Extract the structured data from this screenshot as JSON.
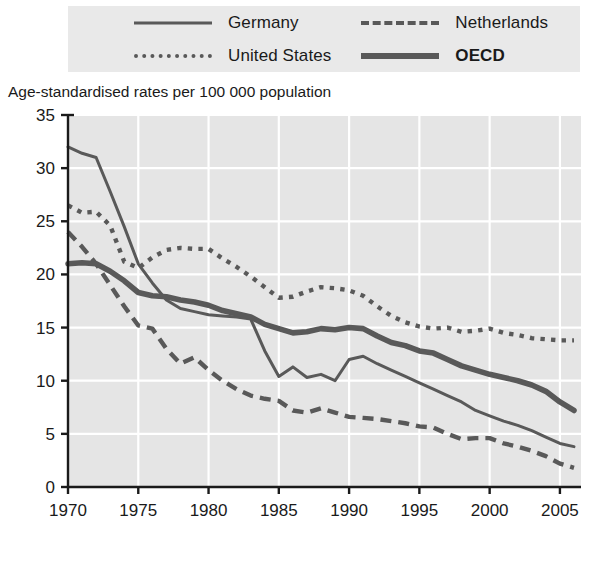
{
  "legend": {
    "items": [
      {
        "label": "Germany",
        "style": "solid-thin",
        "name": "legend-item-germany"
      },
      {
        "label": "Netherlands",
        "style": "dashed",
        "name": "legend-item-netherlands"
      },
      {
        "label": "United States",
        "style": "dotted",
        "name": "legend-item-united-states"
      },
      {
        "label": "OECD",
        "style": "solid-thick",
        "name": "legend-item-oecd",
        "bold": true
      }
    ]
  },
  "subtitle": "Age-standardised rates per 100 000 population",
  "colors": {
    "line": "#595959",
    "plot_background": "#e5e5e5",
    "gridline": "#ffffff",
    "axis": "#1a1a1a",
    "legend_background": "#e9e9e9"
  },
  "chart_data": {
    "type": "line",
    "title": "",
    "subtitle": "Age-standardised rates per 100 000 population",
    "xlabel": "",
    "ylabel": "Age-standardised rates per 100 000 population",
    "xlim": [
      1970,
      2006.5
    ],
    "ylim": [
      0,
      35
    ],
    "xticks": [
      1970,
      1975,
      1980,
      1985,
      1990,
      1995,
      2000,
      2005
    ],
    "xtick_labels": [
      "1970",
      "1975",
      "1980",
      "1985",
      "1990",
      "1995",
      "2000",
      "2005"
    ],
    "yticks": [
      0,
      5,
      10,
      15,
      20,
      25,
      30,
      35
    ],
    "ytick_labels": [
      "0",
      "5",
      "10",
      "15",
      "20",
      "25",
      "30",
      "35"
    ],
    "grid": true,
    "legend_position": "top",
    "x": [
      1970,
      1971,
      1972,
      1973,
      1974,
      1975,
      1976,
      1977,
      1978,
      1979,
      1980,
      1981,
      1982,
      1983,
      1984,
      1985,
      1986,
      1987,
      1988,
      1989,
      1990,
      1991,
      1992,
      1993,
      1994,
      1995,
      1996,
      1997,
      1998,
      1999,
      2000,
      2001,
      2002,
      2003,
      2004,
      2005,
      2006
    ],
    "series": [
      {
        "name": "Germany",
        "style": "solid-thin",
        "values": [
          32.0,
          31.4,
          31.0,
          27.8,
          24.5,
          21.0,
          19.2,
          17.6,
          16.8,
          16.5,
          16.2,
          16.1,
          16.0,
          15.8,
          12.8,
          10.4,
          11.3,
          10.3,
          10.6,
          10.0,
          12.0,
          12.3,
          11.6,
          11.0,
          10.4,
          9.8,
          9.2,
          8.6,
          8.0,
          7.2,
          6.7,
          6.2,
          5.8,
          5.3,
          4.7,
          4.1,
          3.8
        ]
      },
      {
        "name": "Netherlands",
        "style": "dashed",
        "values": [
          24.0,
          22.6,
          21.0,
          19.0,
          17.0,
          15.2,
          14.9,
          13.0,
          11.6,
          12.2,
          11.0,
          10.0,
          9.2,
          8.6,
          8.3,
          8.1,
          7.2,
          7.0,
          7.4,
          7.0,
          6.6,
          6.5,
          6.4,
          6.2,
          6.0,
          5.7,
          5.6,
          5.0,
          4.5,
          4.6,
          4.6,
          4.1,
          3.8,
          3.4,
          2.9,
          2.2,
          1.8
        ]
      },
      {
        "name": "United States",
        "style": "dotted",
        "values": [
          26.5,
          25.8,
          25.9,
          24.6,
          21.2,
          20.6,
          21.6,
          22.3,
          22.5,
          22.4,
          22.4,
          21.5,
          20.7,
          19.8,
          18.8,
          17.8,
          17.9,
          18.4,
          18.8,
          18.7,
          18.5,
          18.0,
          17.0,
          16.1,
          15.5,
          15.1,
          14.9,
          15.0,
          14.6,
          14.7,
          14.9,
          14.5,
          14.3,
          14.0,
          13.9,
          13.8,
          13.8
        ]
      },
      {
        "name": "OECD",
        "style": "solid-thick",
        "values": [
          21.0,
          21.1,
          21.0,
          20.3,
          19.4,
          18.3,
          18.0,
          17.9,
          17.6,
          17.4,
          17.1,
          16.6,
          16.3,
          16.0,
          15.3,
          14.9,
          14.5,
          14.6,
          14.9,
          14.8,
          15.0,
          14.9,
          14.2,
          13.6,
          13.3,
          12.8,
          12.6,
          12.0,
          11.4,
          11.0,
          10.6,
          10.3,
          10.0,
          9.6,
          9.0,
          8.0,
          7.2
        ]
      }
    ]
  }
}
